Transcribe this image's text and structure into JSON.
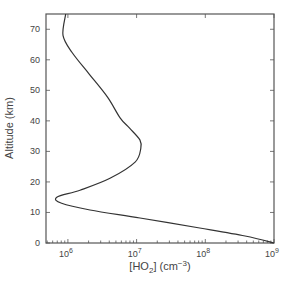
{
  "chart_data": {
    "type": "line",
    "title": "",
    "xlabel": "[HO2] (cm-3)",
    "xlabel_parts": {
      "base": "[HO",
      "sub": "2",
      "mid": "] (cm",
      "sup": "−3",
      "end": ")"
    },
    "ylabel": "Altitude (km)",
    "xscale": "log",
    "xlim": [
      480000,
      1000000000
    ],
    "ylim": [
      0,
      75
    ],
    "x_ticks": [
      {
        "value": 1000000,
        "base": "10",
        "exp": "6"
      },
      {
        "value": 10000000,
        "base": "10",
        "exp": "7"
      },
      {
        "value": 100000000,
        "base": "10",
        "exp": "8"
      },
      {
        "value": 1000000000,
        "base": "10",
        "exp": "9"
      }
    ],
    "y_ticks": [
      0,
      10,
      20,
      30,
      40,
      50,
      60,
      70
    ],
    "grid": false,
    "legend": null,
    "series": [
      {
        "name": "HO2 profile",
        "color": "#333333",
        "points": [
          {
            "x": 930000,
            "y": 75
          },
          {
            "x": 850000,
            "y": 68
          },
          {
            "x": 1150000,
            "y": 62.4
          },
          {
            "x": 2100000,
            "y": 55
          },
          {
            "x": 3800000,
            "y": 47.7
          },
          {
            "x": 5750000,
            "y": 41
          },
          {
            "x": 7900000,
            "y": 37.6
          },
          {
            "x": 11200000,
            "y": 33.7
          },
          {
            "x": 11500000,
            "y": 31
          },
          {
            "x": 9500000,
            "y": 26.5
          },
          {
            "x": 4100000,
            "y": 21.2
          },
          {
            "x": 1500000,
            "y": 17.3
          },
          {
            "x": 690000,
            "y": 15
          },
          {
            "x": 810000,
            "y": 13
          },
          {
            "x": 2100000,
            "y": 10.8
          },
          {
            "x": 11200000,
            "y": 8.2
          },
          {
            "x": 83000000,
            "y": 4.9
          },
          {
            "x": 380000000,
            "y": 2.3
          },
          {
            "x": 1000000000,
            "y": 0
          }
        ]
      }
    ]
  },
  "plot_area": {
    "left": 46,
    "top": 14,
    "right": 274,
    "bottom": 243
  }
}
